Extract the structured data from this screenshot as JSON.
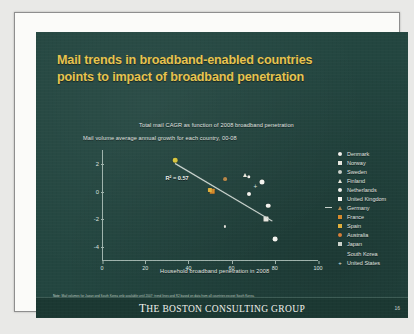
{
  "slide": {
    "title_line1": "Mail trends in broadband-enabled countries",
    "title_line2": "points to impact of broadband penetration",
    "subtitle_main": "Total mail CAGR as function of 2008 broadband penetration",
    "subtitle_axis": "Mail volume average annual growth for each country, 00-08",
    "footnote_label": "Note:",
    "footnote_text": "Mail volumes for Japan and South Korea only available until 2007; trend lines and R2 based on data from all countries except South Korea.",
    "source_label": "Source:",
    "source_text": "UPU, Eurostat, Comscore, OECD, Internet worldstats and BCG analysis",
    "footer_logo_the": "T",
    "footer_logo": "HE BOSTON CONSULTING GROUP",
    "page_number": "16",
    "background_color": "#234640",
    "title_color": "#e8c44e",
    "accent_color": "#e8c44e"
  },
  "chart_data": {
    "type": "scatter",
    "title": "Total mail CAGR as function of 2008 broadband penetration",
    "xlabel": "Household broadband penetration in 2008",
    "ylabel": "",
    "xlim": [
      0,
      100
    ],
    "ylim": [
      -5,
      3
    ],
    "xticks": [
      "0",
      "20",
      "40",
      "60",
      "80",
      "100"
    ],
    "xtick_values": [
      0,
      20,
      40,
      60,
      80,
      100
    ],
    "yticks": [
      "2",
      "0",
      "-2",
      "-4"
    ],
    "ytick_values": [
      2,
      0,
      -2,
      -4
    ],
    "grid": false,
    "annotation": "R² = 0.57",
    "r_squared": 0.57,
    "trendline": {
      "x_start": 34,
      "y_start": 2.05,
      "x_end": 79,
      "y_end": -2.1
    },
    "legend_position": "right",
    "points": [
      {
        "country": "Denmark",
        "x": 74,
        "y": 0.7,
        "marker": "circle",
        "color": "#f4f4ef",
        "size": 5.0
      },
      {
        "country": "Norway",
        "x": 76,
        "y": -2.0,
        "marker": "square",
        "color": "#e8e8e0",
        "size": 5.0
      },
      {
        "country": "Sweden",
        "x": 68,
        "y": 1.05,
        "marker": "circle",
        "color": "#f2f2ec",
        "size": 3.4
      },
      {
        "country": "Finland",
        "x": 66,
        "y": 1.2,
        "marker": "tri",
        "color": "#eceade",
        "size": 4.4
      },
      {
        "country": "Netherlands",
        "x": 77,
        "y": -1.0,
        "marker": "circle",
        "color": "#f4f4ef",
        "size": 4.6
      },
      {
        "country": "United Kingdom",
        "x": 68,
        "y": -0.15,
        "marker": "circle",
        "color": "#f7f7f2",
        "size": 4.0
      },
      {
        "country": "Germany",
        "x": 57,
        "y": 0.9,
        "marker": "circle",
        "color": "#b8884a",
        "size": 3.8
      },
      {
        "country": "France",
        "x": 51,
        "y": 0.05,
        "marker": "square",
        "color": "#d98a2b",
        "size": 4.6
      },
      {
        "country": "Spain",
        "x": 50,
        "y": 0.12,
        "marker": "square",
        "color": "#e0b03c",
        "size": 4.2
      },
      {
        "country": "Australia",
        "x": 34,
        "y": 2.25,
        "marker": "circle",
        "color": "#d8c63e",
        "size": 4.6
      },
      {
        "country": "Japan",
        "x": 57,
        "y": -2.5,
        "marker": "circle",
        "color": "#e7e7df",
        "size": 2.2
      },
      {
        "country": "South Korea",
        "x": 80,
        "y": -3.4,
        "marker": "circle",
        "color": "#f4f4ef",
        "size": 4.8
      },
      {
        "country": "United States",
        "x": 71,
        "y": 0.35,
        "marker": "plus",
        "color": "#dfe5e0",
        "size": 5.0
      }
    ]
  },
  "legend": {
    "items": [
      {
        "label": "Denmark",
        "marker": "circle",
        "color": "#f4f4ef"
      },
      {
        "label": "Norway",
        "marker": "square",
        "color": "#e8e8e0"
      },
      {
        "label": "Sweden",
        "marker": "circle",
        "color": "#cdd4cd"
      },
      {
        "label": "Finland",
        "marker": "tri",
        "color": "#eceade"
      },
      {
        "label": "Netherlands",
        "marker": "circle",
        "color": "#f4f4ef"
      },
      {
        "label": "United Kingdom",
        "marker": "square",
        "color": "#f7f7f2"
      },
      {
        "label": "Germany",
        "marker": "tri",
        "color": "#b8884a"
      },
      {
        "label": "France",
        "marker": "square",
        "color": "#d98a2b"
      },
      {
        "label": "Spain",
        "marker": "square",
        "color": "#e0b03c"
      },
      {
        "label": "Australia",
        "marker": "circle",
        "color": "#d8803a"
      },
      {
        "label": "Japan",
        "marker": "square",
        "color": "#cdd4cd"
      },
      {
        "label": "South Korea",
        "marker": "none",
        "color": "#cdd4cd"
      },
      {
        "label": "United States",
        "marker": "plus",
        "color": "#dfe5e0"
      }
    ]
  }
}
